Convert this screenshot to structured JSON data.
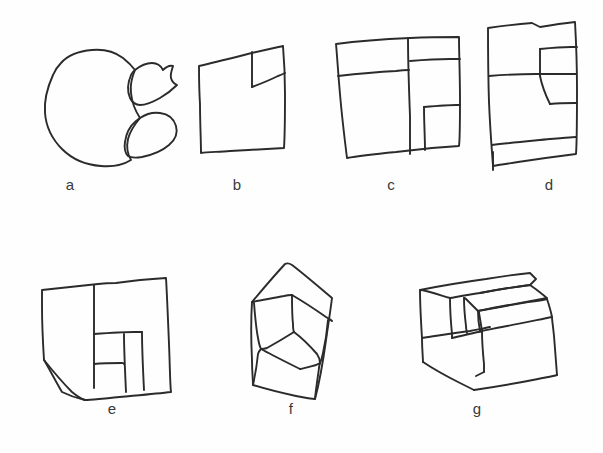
{
  "page": {
    "background_color": "#fefefe",
    "ink_color": "#2b2b2b",
    "width": 603,
    "height": 453
  },
  "figures": [
    {
      "id": "a",
      "caption": "a",
      "description": "three overlapping closed blob outlines: one large round blob at left with two smaller leaf-shaped lobes overlapping on its right side",
      "caption_x": 70,
      "caption_y": 176
    },
    {
      "id": "b",
      "caption": "b",
      "description": "a hand-drawn square with a small notched quadrilateral tab cut into its upper-right corner",
      "caption_x": 237,
      "caption_y": 176
    },
    {
      "id": "c",
      "caption": "c",
      "description": "a hand-drawn square divided by one vertical line and several horizontal lines into five irregular rectangular cells",
      "caption_x": 391,
      "caption_y": 176
    },
    {
      "id": "d",
      "caption": "d",
      "description": "a tall hand-drawn rectangle split by horizontal and stepped vertical lines into four irregular regions, with a short stray tick at the lower left",
      "caption_x": 549,
      "caption_y": 176
    },
    {
      "id": "e",
      "caption": "e",
      "description": "a cube-like solid drawn in perspective with a rectangular notch cut into its front face, subdivided into smaller faces",
      "caption_x": 112,
      "caption_y": 407
    },
    {
      "id": "f",
      "caption": "f",
      "description": "a house-pentagon outline containing a nested cube drawn in isometric perspective",
      "caption_x": 291,
      "caption_y": 407
    },
    {
      "id": "g",
      "caption": "g",
      "description": "a stepped block solid drawn in isometric perspective resembling two stacked boxes forming a stair",
      "caption_x": 477,
      "caption_y": 407
    }
  ]
}
